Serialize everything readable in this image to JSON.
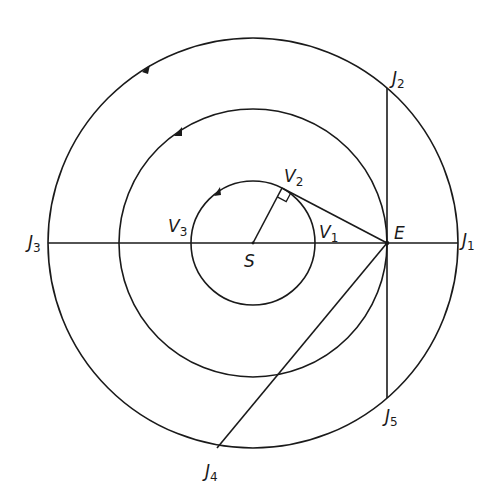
{
  "diagram": {
    "colors": {
      "stroke": "#1a1a1a",
      "background": "#ffffff"
    },
    "center": {
      "label": "S",
      "x": 253,
      "y": 243
    },
    "orbits": [
      {
        "name": "venus-orbit",
        "r": 62
      },
      {
        "name": "earth-orbit",
        "r": 134
      },
      {
        "name": "jupiter-orbit",
        "r": 205
      }
    ],
    "labels": {
      "S": {
        "main": "S",
        "sub": ""
      },
      "E": {
        "main": "E",
        "sub": ""
      },
      "V1": {
        "main": "V",
        "sub": "1"
      },
      "V2": {
        "main": "V",
        "sub": "2"
      },
      "V3": {
        "main": "V",
        "sub": "3"
      },
      "J1": {
        "main": "J",
        "sub": "1"
      },
      "J2": {
        "main": "J",
        "sub": "2"
      },
      "J3": {
        "main": "J",
        "sub": "3"
      },
      "J4": {
        "main": "J",
        "sub": "4"
      },
      "J5": {
        "main": "J",
        "sub": "5"
      }
    },
    "points": {
      "E": [
        387,
        243
      ],
      "V2": [
        282,
        188
      ],
      "J1": [
        458,
        243
      ],
      "J2": [
        387,
        88
      ],
      "J3": [
        48,
        243
      ],
      "J4": [
        217,
        448
      ],
      "J5": [
        387,
        398
      ]
    },
    "direction": "counterclockwise"
  }
}
